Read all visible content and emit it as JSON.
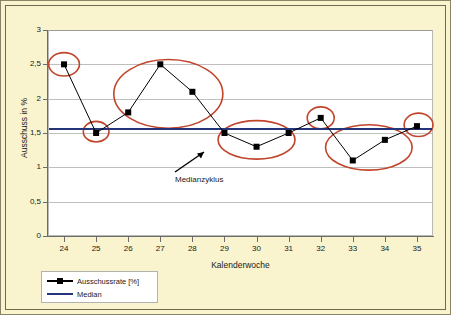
{
  "chart_data": {
    "type": "line",
    "title": "",
    "xlabel": "Kalenderwoche",
    "ylabel": "Ausschuss in %",
    "xlim": [
      23.5,
      35.5
    ],
    "ylim": [
      0,
      3
    ],
    "grid": true,
    "legend_position": "below-left",
    "x": [
      24,
      25,
      26,
      27,
      28,
      29,
      30,
      31,
      32,
      33,
      34,
      35
    ],
    "xtick_labels": [
      "24",
      "25",
      "26",
      "27",
      "28",
      "29",
      "30",
      "31",
      "32",
      "33",
      "34",
      "35"
    ],
    "ytick_values": [
      0,
      0.5,
      1,
      1.5,
      2,
      2.5,
      3
    ],
    "ytick_labels": [
      "0",
      "0,5",
      "1",
      "1,5",
      "2",
      "2,5",
      "3"
    ],
    "series": [
      {
        "name": "Ausschussrate [%]",
        "type": "line",
        "color": "#000000",
        "marker": "square",
        "values": [
          2.5,
          1.5,
          1.8,
          2.5,
          2.1,
          1.5,
          1.3,
          1.5,
          1.72,
          1.1,
          1.4,
          1.6
        ]
      },
      {
        "name": "Median",
        "type": "hline",
        "color": "#24357a",
        "value": 1.56
      }
    ],
    "annotations": [
      {
        "name": "medianzyklus-label",
        "text": "Medianzyklus",
        "x": 29.55,
        "y": 0.72
      }
    ],
    "highlight_ellipses": [
      {
        "name": "cycle-1",
        "cx": 24.0,
        "cy": 2.5,
        "rx": 0.48,
        "ry": 0.17
      },
      {
        "name": "cycle-2",
        "cx": 25.0,
        "cy": 1.52,
        "rx": 0.4,
        "ry": 0.15
      },
      {
        "name": "cycle-3",
        "cx": 27.25,
        "cy": 2.07,
        "rx": 1.7,
        "ry": 0.5
      },
      {
        "name": "cycle-4",
        "cx": 30.0,
        "cy": 1.4,
        "rx": 1.2,
        "ry": 0.28
      },
      {
        "name": "cycle-5",
        "cx": 32.0,
        "cy": 1.72,
        "rx": 0.42,
        "ry": 0.16
      },
      {
        "name": "cycle-6",
        "cx": 33.5,
        "cy": 1.29,
        "rx": 1.35,
        "ry": 0.33
      },
      {
        "name": "cycle-7",
        "cx": 35.05,
        "cy": 1.62,
        "rx": 0.45,
        "ry": 0.17
      }
    ]
  },
  "legend": {
    "items": [
      {
        "label": "Ausschussrate [%]",
        "key": "line-square-marker"
      },
      {
        "label": "Median",
        "key": "line-solid"
      }
    ]
  },
  "colors": {
    "background": "#f9f4cd",
    "plot_background": "#ffffff",
    "gridline": "#bfbfbf",
    "series_line": "#000000",
    "median_line": "#24357a",
    "ellipse": "#c0452b",
    "arrow": "#000000",
    "frame_border": "#6f6a4e"
  }
}
